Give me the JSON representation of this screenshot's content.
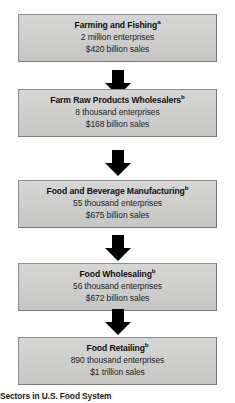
{
  "caption": "Sectors in U.S. Food System",
  "stages": [
    {
      "title": "Farming and Fishing",
      "footnote": "a",
      "enterprises": "2 million enterprises",
      "sales": "$420 billion sales",
      "name": "farming-and-fishing"
    },
    {
      "title": "Farm Raw Products Wholesalers",
      "footnote": "b",
      "enterprises": "8 thousand enterprises",
      "sales": "$168 billion sales",
      "name": "farm-raw-products-wholesalers"
    },
    {
      "title": "Food and Beverage Manufacturing",
      "footnote": "b",
      "enterprises": "55 thousand enterprises",
      "sales": "$675 billion sales",
      "name": "food-and-beverage-manufacturing"
    },
    {
      "title": "Food Wholesaling",
      "footnote": "b",
      "enterprises": "56 thousand enterprises",
      "sales": "$672 billion sales",
      "name": "food-wholesaling"
    },
    {
      "title": "Food Retailing",
      "footnote": "b",
      "enterprises": "890 thousand enterprises",
      "sales": "$1 trillion sales",
      "name": "food-retailing"
    }
  ],
  "arrows": [
    {
      "label": "down-arrow"
    },
    {
      "label": "down-arrow"
    },
    {
      "label": "down-arrow"
    },
    {
      "label": "down-arrow"
    }
  ],
  "colors": {
    "box_fill": "#cfcfcd",
    "box_border": "#8d8d8b",
    "arrow": "#000000",
    "text": "#1a1a1a"
  },
  "layout": {
    "box_tops": [
      14,
      89,
      180,
      263,
      337
    ],
    "box_height": 56,
    "arrow_tops": [
      70,
      150,
      235,
      309
    ]
  }
}
